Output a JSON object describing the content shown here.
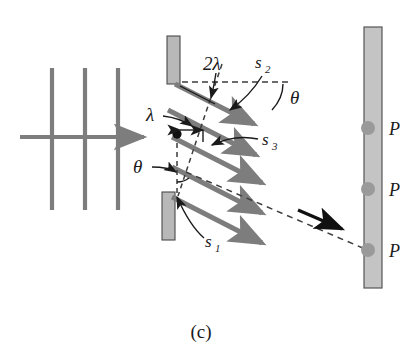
{
  "figure": {
    "caption": "(c)"
  },
  "labels": {
    "path_difference_two_lambda": "2λ",
    "path_difference_lambda": "λ",
    "angle_theta_top": "θ",
    "angle_theta_left": "θ",
    "slit_s1": "s",
    "slit_s1_sub": "1",
    "slit_s2": "s",
    "slit_s2_sub": "2",
    "slit_s3": "s",
    "slit_s3_sub": "3",
    "screen_point_top": "P",
    "screen_point_middle": "P",
    "screen_point_bottom": "P"
  },
  "colors": {
    "ray_gray": "#7d7d7d",
    "barrier_fill": "#b8b8b8",
    "barrier_stroke": "#4a4a4a",
    "screen_fill": "#c4c4c4",
    "screen_stroke": "#555555",
    "dot_gray": "#9a9a9a",
    "ink_black": "#1a1a1a",
    "dashed_gray": "#4a4a4a",
    "wavefront_gray": "#7d7d7d"
  },
  "geometry": {
    "wavefront_lines_x": [
      52,
      85,
      118
    ],
    "wavefront_top_y": 68,
    "wavefront_bottom_y": 210,
    "incident_arrow_y": 137,
    "incident_arrow_x_start": 20,
    "incident_arrow_x_end": 150,
    "upper_barrier": {
      "x": 167,
      "y": 36,
      "w": 13,
      "h": 48
    },
    "lower_barrier": {
      "x": 162,
      "y": 192,
      "w": 13,
      "h": 48
    },
    "screen": {
      "x": 364,
      "y": 27,
      "w": 18,
      "h": 261
    },
    "screen_dots_y": [
      128,
      189,
      250
    ],
    "ray_count": 5,
    "ray_angle_degrees": 27
  }
}
